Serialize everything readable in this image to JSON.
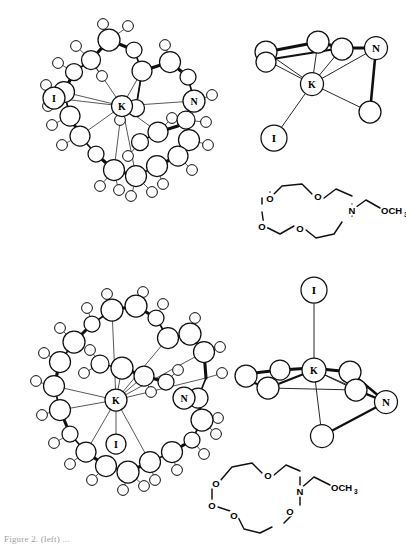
{
  "figure": {
    "background_color": "#ffffff",
    "line_color": "#101010",
    "caption_text": "Figure 2. (left) ..."
  },
  "panels": [
    {
      "id": "top-left",
      "name": "ortep-structure-upper",
      "type": "ortep-ball-and-stick",
      "description": "Ball-and-stick crystal structure of the potassium iodide aza-crown complex",
      "labels": [
        "K",
        "I",
        "N"
      ],
      "center_atom": "K",
      "anion": "I",
      "donor_heteroatom": "N"
    },
    {
      "id": "top-right",
      "name": "coordination-polyhedron-upper",
      "type": "coordination-polyhedron",
      "description": "Coordination polyhedron about the potassium ion, iodide pendant below left",
      "labels": [
        "K",
        "N",
        "I"
      ],
      "center_atom": "K",
      "iodide_position": "lower-left"
    },
    {
      "id": "mid-right",
      "name": "skeletal-formula-upper",
      "type": "skeletal-formula",
      "description": "Monoaza-15-crown-5 bearing a 2-methoxyethyl arm",
      "ring_oxygens": 4,
      "ring_nitrogens": 1,
      "oxygen_label": "O",
      "nitrogen_label": "N",
      "sidechain_label": "OCH",
      "sidechain_subscript": "3"
    },
    {
      "id": "bottom-left",
      "name": "ortep-structure-lower",
      "type": "ortep-ball-and-stick",
      "description": "Ball-and-stick crystal structure of the potassium iodide aza-crown complex, iodide coordinated below K",
      "labels": [
        "K",
        "I",
        "N"
      ],
      "center_atom": "K",
      "anion": "I",
      "donor_heteroatom": "N"
    },
    {
      "id": "bottom-right",
      "name": "coordination-polyhedron-lower",
      "type": "coordination-polyhedron",
      "description": "Coordination polyhedron about the potassium ion, iodide apical above K",
      "labels": [
        "I",
        "K",
        "N"
      ],
      "center_atom": "K",
      "iodide_position": "apical-top"
    },
    {
      "id": "bottom-mid",
      "name": "skeletal-formula-lower",
      "type": "skeletal-formula",
      "description": "Monoaza-18-crown-6 bearing a 2-methoxyethyl arm",
      "ring_oxygens": 5,
      "ring_nitrogens": 1,
      "oxygen_label": "O",
      "nitrogen_label": "N",
      "sidechain_label": "OCH",
      "sidechain_subscript": "3"
    }
  ],
  "atom_labels": {
    "potassium": "K",
    "iodide": "I",
    "nitrogen": "N",
    "oxygen": "O"
  }
}
